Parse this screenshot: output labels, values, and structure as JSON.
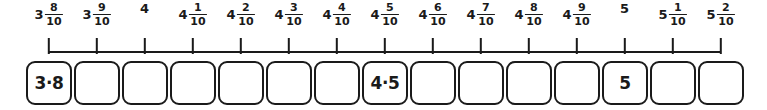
{
  "worksheet": {
    "type": "number-line-with-answer-boxes",
    "line_color": "#1a1a1a",
    "box_border_color": "#1a1a1a",
    "background_color": "#ffffff",
    "tick_count": 15,
    "box_count": 15,
    "decimal_separator": "·"
  },
  "ticks": [
    {
      "whole": "3",
      "numerator": "8",
      "denominator": "10",
      "center_x": 48.5
    },
    {
      "whole": "3",
      "numerator": "9",
      "denominator": "10",
      "center_x": 96.5
    },
    {
      "whole": "4",
      "numerator": "",
      "denominator": "",
      "center_x": 144.5
    },
    {
      "whole": "4",
      "numerator": "1",
      "denominator": "10",
      "center_x": 192.5
    },
    {
      "whole": "4",
      "numerator": "2",
      "denominator": "10",
      "center_x": 240.5
    },
    {
      "whole": "4",
      "numerator": "3",
      "denominator": "10",
      "center_x": 288.5
    },
    {
      "whole": "4",
      "numerator": "4",
      "denominator": "10",
      "center_x": 336.5
    },
    {
      "whole": "4",
      "numerator": "5",
      "denominator": "10",
      "center_x": 384.5
    },
    {
      "whole": "4",
      "numerator": "6",
      "denominator": "10",
      "center_x": 432.5
    },
    {
      "whole": "4",
      "numerator": "7",
      "denominator": "10",
      "center_x": 480.5
    },
    {
      "whole": "4",
      "numerator": "8",
      "denominator": "10",
      "center_x": 528.5
    },
    {
      "whole": "4",
      "numerator": "9",
      "denominator": "10",
      "center_x": 576.5
    },
    {
      "whole": "5",
      "numerator": "",
      "denominator": "",
      "center_x": 624.5
    },
    {
      "whole": "5",
      "numerator": "1",
      "denominator": "10",
      "center_x": 672.5
    },
    {
      "whole": "5",
      "numerator": "2",
      "denominator": "10",
      "center_x": 720.5
    }
  ],
  "axis": {
    "start_x": 48.5,
    "end_x": 720.5
  },
  "boxes": [
    {
      "value": "3·8",
      "left": 26,
      "width": 46,
      "filled": true
    },
    {
      "value": "",
      "left": 74,
      "width": 46,
      "filled": false
    },
    {
      "value": "",
      "left": 122,
      "width": 46,
      "filled": false
    },
    {
      "value": "",
      "left": 170,
      "width": 46,
      "filled": false
    },
    {
      "value": "",
      "left": 218,
      "width": 46,
      "filled": false
    },
    {
      "value": "",
      "left": 266,
      "width": 46,
      "filled": false
    },
    {
      "value": "",
      "left": 314,
      "width": 46,
      "filled": false
    },
    {
      "value": "4·5",
      "left": 362,
      "width": 46,
      "filled": true
    },
    {
      "value": "",
      "left": 410,
      "width": 46,
      "filled": false
    },
    {
      "value": "",
      "left": 458,
      "width": 46,
      "filled": false
    },
    {
      "value": "",
      "left": 506,
      "width": 46,
      "filled": false
    },
    {
      "value": "",
      "left": 554,
      "width": 46,
      "filled": false
    },
    {
      "value": "5",
      "left": 602,
      "width": 46,
      "filled": true
    },
    {
      "value": "",
      "left": 650,
      "width": 46,
      "filled": false
    },
    {
      "value": "",
      "left": 698,
      "width": 46,
      "filled": false
    }
  ]
}
